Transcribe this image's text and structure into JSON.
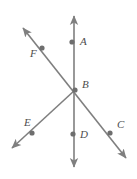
{
  "figure": {
    "background_color": "#ffffff",
    "stroke_color": "#7f7f7f",
    "point_color": "#6e6e6e",
    "label_color": "#4d4d4d",
    "stroke_width": 1.6,
    "point_radius": 2.6,
    "width": 137,
    "height": 179
  },
  "labels": {
    "a": "A",
    "b": "B",
    "c": "C",
    "d": "D",
    "e": "E",
    "f": "F"
  },
  "points": [
    {
      "name": "A",
      "label": "A",
      "x": 72,
      "y": 42,
      "label_x": 80,
      "label_y": 45
    },
    {
      "name": "B",
      "label": "B",
      "x": 75,
      "y": 90,
      "label_x": 82,
      "label_y": 88
    },
    {
      "name": "C",
      "label": "C",
      "x": 110,
      "y": 133,
      "label_x": 117,
      "label_y": 128
    },
    {
      "name": "D",
      "label": "D",
      "x": 73,
      "y": 134,
      "label_x": 80,
      "label_y": 138
    },
    {
      "name": "E",
      "label": "E",
      "x": 32,
      "y": 133,
      "label_x": 24,
      "label_y": 126
    },
    {
      "name": "F",
      "label": "F",
      "x": 42,
      "y": 48,
      "label_x": 30,
      "label_y": 57
    }
  ],
  "lines": [
    {
      "name": "vertical-line-AD",
      "description": "Vertical double-headed line through A, B and D",
      "x1": 74,
      "y1": 16,
      "x2": 74,
      "y2": 167,
      "arrow_start": true,
      "arrow_end": true
    },
    {
      "name": "diagonal-line-FC",
      "description": "Double-headed line from upper-left through F, B, C to lower-right",
      "x1": 23,
      "y1": 28,
      "x2": 126,
      "y2": 158,
      "arrow_start": true,
      "arrow_end": true
    },
    {
      "name": "ray-BE",
      "description": "Ray from B through E toward lower-left",
      "x1": 75,
      "y1": 90,
      "x2": 12,
      "y2": 148,
      "arrow_start": false,
      "arrow_end": true
    }
  ]
}
